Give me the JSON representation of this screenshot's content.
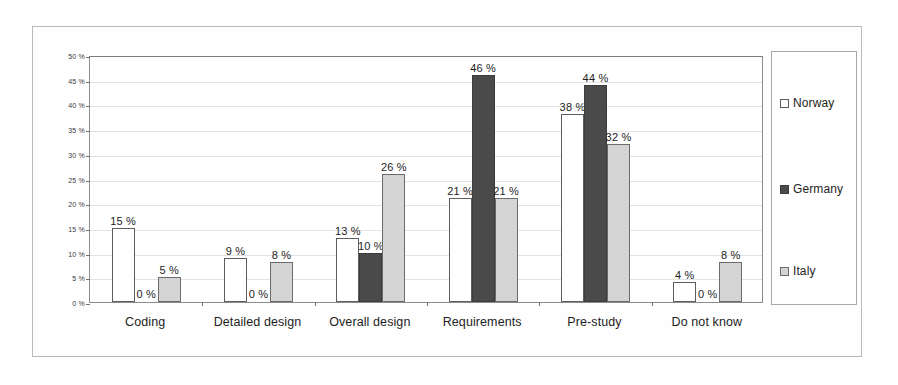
{
  "chart_data": {
    "type": "bar",
    "title": "",
    "subtitle": "",
    "xlabel": "",
    "ylabel": "",
    "ylim": [
      0,
      50
    ],
    "ytick_labels": [
      "0 %",
      "5 %",
      "10 %",
      "15 %",
      "20 %",
      "25 %",
      "30 %",
      "35 %",
      "40 %",
      "45 %",
      "50 %"
    ],
    "ytick_values": [
      0,
      5,
      10,
      15,
      20,
      25,
      30,
      35,
      40,
      45,
      50
    ],
    "grid": true,
    "legend_position": "right",
    "value_label_suffix": " %",
    "categories": [
      "Coding",
      "Detailed design",
      "Overall design",
      "Requirements",
      "Pre-study",
      "Do not know"
    ],
    "series": [
      {
        "name": "Norway",
        "color": "#ffffff",
        "border": "#5d5d5d",
        "values": [
          15,
          9,
          13,
          21,
          38,
          4
        ],
        "labels": [
          "15 %",
          "9 %",
          "13 %",
          "21 %",
          "38 %",
          "4 %"
        ]
      },
      {
        "name": "Germany",
        "color": "#4a4a4a",
        "border": "#3b3b3b",
        "values": [
          0,
          0,
          10,
          46,
          44,
          0
        ],
        "labels": [
          "0 %",
          "0 %",
          "10 %",
          "46 %",
          "44 %",
          "0 %"
        ]
      },
      {
        "name": "Italy",
        "color": "#d4d4d4",
        "border": "#6b6b6b",
        "values": [
          5,
          8,
          26,
          21,
          32,
          8
        ],
        "labels": [
          "5 %",
          "8 %",
          "26 %",
          "21 %",
          "32 %",
          "8 %"
        ]
      }
    ]
  },
  "legend": {
    "entries": [
      {
        "label": "Norway"
      },
      {
        "label": "Germany"
      },
      {
        "label": "Italy"
      }
    ]
  }
}
